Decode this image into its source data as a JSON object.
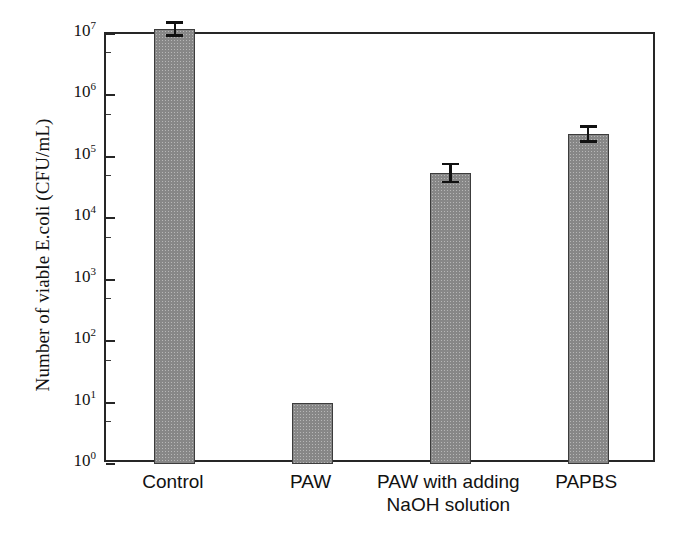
{
  "chart_data": {
    "type": "bar",
    "title": "",
    "xlabel": "",
    "ylabel": "Number of viable E.coli (CFU/mL)",
    "yscale": "log",
    "ylim": [
      1,
      10000000
    ],
    "grid": false,
    "legend": null,
    "categories": [
      "Control",
      "PAW",
      "PAW with adding NaOH solution",
      "PAPBS"
    ],
    "category_lines": [
      [
        "Control"
      ],
      [
        "PAW"
      ],
      [
        "PAW with adding",
        "NaOH solution"
      ],
      [
        "PAPBS"
      ]
    ],
    "values": [
      12000000,
      10,
      55000,
      240000
    ],
    "errors_upper": [
      4000000,
      0,
      25000,
      90000
    ],
    "errors_lower": [
      3000000,
      0,
      18000,
      70000
    ],
    "bar_color": "#878787",
    "bar_edge_color": "#3c3c3c",
    "axis_color": "#262626",
    "error_color": "#111111",
    "y_ticks": [
      {
        "exp": "0",
        "base": "10",
        "label": "10^0"
      },
      {
        "exp": "1",
        "base": "10",
        "label": "10^1"
      },
      {
        "exp": "2",
        "base": "10",
        "label": "10^2"
      },
      {
        "exp": "3",
        "base": "10",
        "label": "10^3"
      },
      {
        "exp": "4",
        "base": "10",
        "label": "10^4"
      },
      {
        "exp": "5",
        "base": "10",
        "label": "10^5"
      },
      {
        "exp": "6",
        "base": "10",
        "label": "10^6"
      },
      {
        "exp": "7",
        "base": "10",
        "label": "10^7"
      }
    ]
  }
}
